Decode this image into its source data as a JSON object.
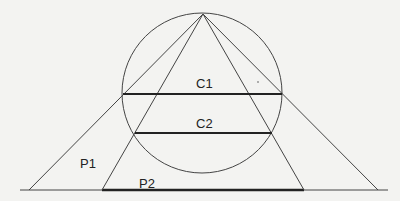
{
  "diagram": {
    "background": "#f3f3f1",
    "stroke_color": "#333333",
    "apex": {
      "x": 203,
      "y": 14
    },
    "circle": {
      "cx": 202,
      "cy": 93,
      "r": 80
    },
    "baseline": {
      "x1": 20,
      "x2": 388,
      "y": 190
    },
    "outer_lines": {
      "left_foot_x": 29,
      "right_foot_x": 378
    },
    "inner_lines": {
      "left_foot_x": 102,
      "right_foot_x": 304
    },
    "chords": [
      {
        "id": "C1",
        "x1": 124,
        "x2": 282,
        "y": 94
      },
      {
        "id": "C2",
        "x1": 135,
        "x2": 272,
        "y": 133
      }
    ],
    "segment_p2": {
      "x1": 102,
      "x2": 304,
      "y": 190
    },
    "labels": {
      "c1": "C1",
      "c2": "C2",
      "p1": "P1",
      "p2": "P2"
    }
  }
}
